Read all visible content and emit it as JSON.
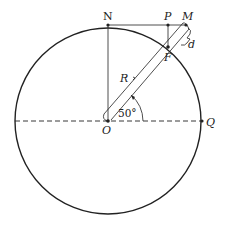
{
  "diagram": {
    "type": "geometry",
    "labels": {
      "N": "N",
      "P": "P",
      "M": "M",
      "F": "F",
      "d": "d",
      "R": "R",
      "O": "O",
      "Q": "Q",
      "angle": "50°"
    },
    "points": {
      "O": [
        108,
        121
      ],
      "N": [
        108,
        25
      ],
      "P": [
        168,
        25
      ],
      "M": [
        186,
        25
      ],
      "F": [
        168,
        47
      ],
      "Q": [
        202,
        121
      ]
    },
    "circle": {
      "cx": 108,
      "cy": 121,
      "r": 93
    },
    "angle_degrees": 50,
    "colors": {
      "stroke": "#222222",
      "background": "#ffffff"
    }
  }
}
